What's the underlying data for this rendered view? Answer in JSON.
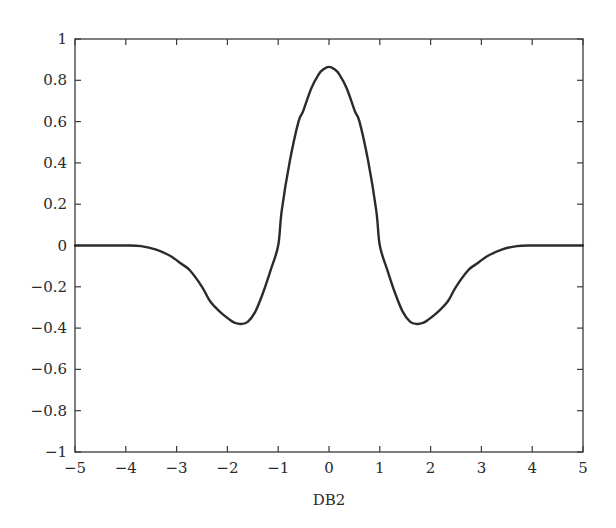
{
  "chart_data": {
    "type": "line",
    "title": "",
    "xlabel": "DB2",
    "ylabel": "",
    "xlim": [
      -5,
      5
    ],
    "ylim": [
      -1,
      1
    ],
    "grid": false,
    "legend": null,
    "xticks": [
      -5,
      -4,
      -3,
      -2,
      -1,
      0,
      1,
      2,
      3,
      4,
      5
    ],
    "xtick_labels": [
      "−5",
      "−4",
      "−3",
      "−2",
      "−1",
      "0",
      "1",
      "2",
      "3",
      "4",
      "5"
    ],
    "yticks": [
      1,
      0.8,
      0.6,
      0.4,
      0.2,
      0,
      -0.2,
      -0.4,
      -0.6,
      -0.8,
      -1
    ],
    "ytick_labels": [
      "1",
      "0.8",
      "0.6",
      "0.4",
      "0.2",
      "0",
      "−0.2",
      "−0.4",
      "−0.6",
      "−0.8",
      "−1"
    ],
    "line_color": "#2b2b2b",
    "series": [
      {
        "name": "DB2",
        "x": [
          -5.0,
          -4.5,
          -4.0,
          -3.7,
          -3.4,
          -3.13,
          -2.9,
          -2.74,
          -2.5,
          -2.34,
          -2.15,
          -1.95,
          -1.85,
          -1.73,
          -1.6,
          -1.45,
          -1.3,
          -1.15,
          -1.0,
          -0.93,
          -0.77,
          -0.6,
          -0.51,
          -0.35,
          -0.2,
          -0.1,
          0.0,
          0.1,
          0.2,
          0.35,
          0.51,
          0.6,
          0.77,
          0.93,
          1.0,
          1.15,
          1.3,
          1.45,
          1.6,
          1.73,
          1.85,
          1.95,
          2.15,
          2.34,
          2.5,
          2.74,
          2.9,
          3.13,
          3.4,
          3.7,
          4.0,
          4.5,
          5.0
        ],
        "y": [
          0.0,
          0.0,
          0.0,
          -0.003,
          -0.02,
          -0.05,
          -0.09,
          -0.12,
          -0.2,
          -0.27,
          -0.32,
          -0.36,
          -0.375,
          -0.38,
          -0.37,
          -0.32,
          -0.23,
          -0.12,
          0.0,
          0.17,
          0.41,
          0.6,
          0.65,
          0.76,
          0.83,
          0.855,
          0.865,
          0.855,
          0.83,
          0.76,
          0.65,
          0.6,
          0.41,
          0.17,
          0.0,
          -0.12,
          -0.23,
          -0.32,
          -0.37,
          -0.38,
          -0.375,
          -0.36,
          -0.32,
          -0.27,
          -0.2,
          -0.12,
          -0.09,
          -0.05,
          -0.02,
          -0.003,
          0.0,
          0.0,
          0.0
        ]
      }
    ]
  },
  "layout": {
    "plot_left": 75,
    "plot_top": 39,
    "plot_right": 583,
    "plot_bottom": 452
  }
}
